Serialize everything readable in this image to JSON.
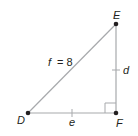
{
  "diagram": {
    "type": "right-triangle",
    "vertices": {
      "D": {
        "label": "D",
        "x": 28,
        "y": 113
      },
      "E": {
        "label": "E",
        "x": 116,
        "y": 24
      },
      "F": {
        "label": "F",
        "x": 116,
        "y": 113
      }
    },
    "sides": {
      "f": {
        "label_var": "f",
        "label_eq": "= 8",
        "from": "D",
        "to": "E"
      },
      "d": {
        "label_var": "d",
        "from": "E",
        "to": "F"
      },
      "e": {
        "label_var": "e",
        "from": "D",
        "to": "F"
      }
    },
    "right_angle_at": "F",
    "congruent_tick_marks_on": [
      "d",
      "e"
    ],
    "colors": {
      "stroke": "#a7a9ac",
      "point": "#231f20",
      "text": "#231f20"
    }
  }
}
